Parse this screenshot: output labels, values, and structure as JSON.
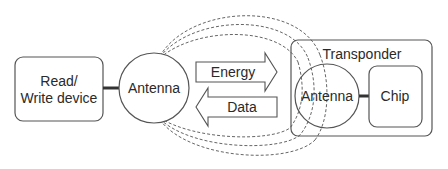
{
  "diagram": {
    "type": "block-diagram",
    "colors": {
      "stroke": "#555555",
      "text": "#2a2a2a",
      "background": "#ffffff",
      "connector": "#333333"
    },
    "reader": {
      "label_line1": "Read/",
      "label_line2": "Write device"
    },
    "reader_antenna": {
      "label": "Antenna"
    },
    "arrows": {
      "energy": {
        "label": "Energy",
        "direction": "right"
      },
      "data": {
        "label": "Data",
        "direction": "left"
      }
    },
    "field_lines": {
      "count": 3,
      "style": "dashed"
    },
    "transponder": {
      "label": "Transponder",
      "antenna": {
        "label": "Antenna"
      },
      "chip": {
        "label": "Chip"
      }
    }
  }
}
